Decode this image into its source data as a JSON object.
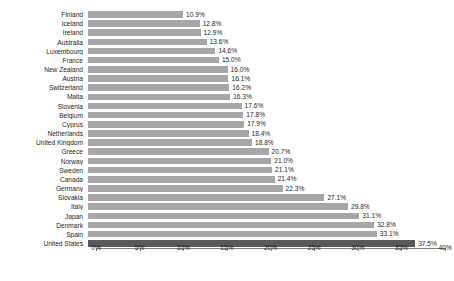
{
  "chart_data": {
    "type": "bar",
    "orientation": "horizontal",
    "title": "",
    "xlabel": "",
    "ylabel": "",
    "xlim": [
      0,
      40
    ],
    "grid": false,
    "legend": null,
    "value_suffix": "%",
    "axis_ticks": [
      "0%",
      "5%",
      "10%",
      "15%",
      "20%",
      "25%",
      "30%",
      "35%",
      "40%"
    ],
    "axis_tick_values": [
      0,
      5,
      10,
      15,
      20,
      25,
      30,
      35,
      40
    ],
    "highlight_category": "United States",
    "categories": [
      "Finland",
      "Iceland",
      "Ireland",
      "Australia",
      "Luxembourg",
      "France",
      "New Zealand",
      "Austria",
      "Switzerland",
      "Malta",
      "Slovenia",
      "Belgium",
      "Cyprus",
      "Netherlands",
      "United Kingdom",
      "Greece",
      "Norway",
      "Sweden",
      "Canada",
      "Germany",
      "Slovakia",
      "Italy",
      "Japan",
      "Denmark",
      "Spain",
      "United States"
    ],
    "values": [
      10.9,
      12.8,
      12.9,
      13.6,
      14.6,
      15.0,
      16.0,
      16.1,
      16.2,
      16.3,
      17.6,
      17.8,
      17.9,
      18.4,
      18.8,
      20.7,
      21.0,
      21.1,
      21.4,
      22.3,
      27.1,
      29.8,
      31.1,
      32.8,
      33.1,
      37.5
    ],
    "data_labels": [
      "10.9%",
      "12.8%",
      "12.9%",
      "13.6%",
      "14.6%",
      "15.0%",
      "16.0%",
      "16.1%",
      "16.2%",
      "16.3%",
      "17.6%",
      "17.8%",
      "17.9%",
      "18.4%",
      "18.8%",
      "20.7%",
      "21.0%",
      "21.1%",
      "21.4%",
      "22.3%",
      "27.1%",
      "29.8%",
      "31.1%",
      "32.8%",
      "33.1%",
      "37.5%"
    ]
  },
  "colors": {
    "bar": "#a6a6a6",
    "bar_highlight": "#595959",
    "axis": "#808080",
    "text": "#231f20",
    "background": "#ffffff"
  },
  "footnote": {
    "text": ""
  }
}
